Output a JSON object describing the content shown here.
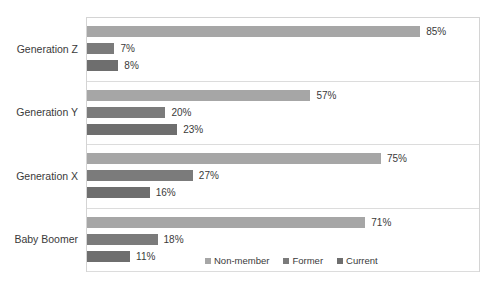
{
  "chart_data": {
    "type": "bar",
    "orientation": "horizontal",
    "title": "",
    "subtitle": "",
    "xlabel": "",
    "ylabel": "",
    "xlim": [
      0,
      100
    ],
    "grid": true,
    "legend_position": "bottom-right",
    "categories": [
      "Generation Z",
      "Generation Y",
      "Generation X",
      "Baby Boomer"
    ],
    "series": [
      {
        "name": "Non-member",
        "color": "#a6a6a6",
        "values": [
          85,
          57,
          75,
          71
        ]
      },
      {
        "name": "Former",
        "color": "#7b7b7b",
        "values": [
          7,
          20,
          27,
          18
        ]
      },
      {
        "name": "Current",
        "color": "#6e6e6e",
        "values": [
          8,
          23,
          16,
          11
        ]
      }
    ],
    "value_labels": [
      [
        "85%",
        "7%",
        "8%"
      ],
      [
        "57%",
        "20%",
        "23%"
      ],
      [
        "75%",
        "27%",
        "16%"
      ],
      [
        "71%",
        "18%",
        "11%"
      ]
    ],
    "groups": [
      {
        "category": "Generation Z",
        "bars": [
          {
            "series": "Non-member",
            "value": 85,
            "label": "85%"
          },
          {
            "series": "Former",
            "value": 7,
            "label": "7%"
          },
          {
            "series": "Current",
            "value": 8,
            "label": "8%"
          }
        ]
      },
      {
        "category": "Generation Y",
        "bars": [
          {
            "series": "Non-member",
            "value": 57,
            "label": "57%"
          },
          {
            "series": "Former",
            "value": 20,
            "label": "20%"
          },
          {
            "series": "Current",
            "value": 23,
            "label": "23%"
          }
        ]
      },
      {
        "category": "Generation X",
        "bars": [
          {
            "series": "Non-member",
            "value": 75,
            "label": "75%"
          },
          {
            "series": "Former",
            "value": 27,
            "label": "27%"
          },
          {
            "series": "Current",
            "value": 16,
            "label": "16%"
          }
        ]
      },
      {
        "category": "Baby Boomer",
        "bars": [
          {
            "series": "Non-member",
            "value": 71,
            "label": "71%"
          },
          {
            "series": "Former",
            "value": 18,
            "label": "18%"
          },
          {
            "series": "Current",
            "value": 11,
            "label": "11%"
          }
        ]
      }
    ],
    "legend": [
      {
        "label": "Non-member",
        "color": "#a6a6a6"
      },
      {
        "label": "Former",
        "color": "#7b7b7b"
      },
      {
        "label": "Current",
        "color": "#6e6e6e"
      }
    ]
  },
  "colors": {
    "plot_border": "#d4d4d4",
    "gridline": "#dcdcdc",
    "text": "#3a3a3a",
    "background": "#ffffff"
  }
}
